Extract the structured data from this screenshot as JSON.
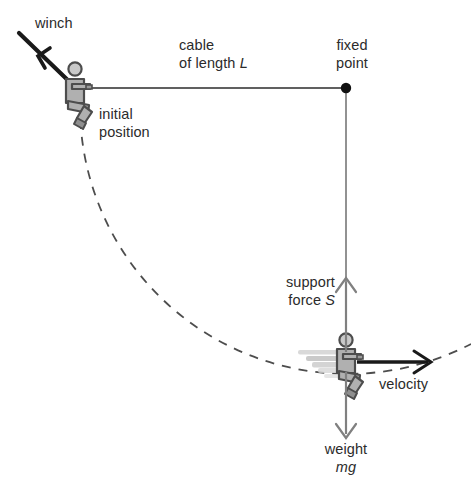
{
  "diagram": {
    "background_color": "#ffffff",
    "labels": {
      "winch": "winch",
      "cable_line1": "cable",
      "cable_line2_prefix": "of length ",
      "cable_line2_symbol": "L",
      "fixed_line1": "fixed",
      "fixed_line2": "point",
      "initial_line1": "initial",
      "initial_line2": "position",
      "support_line1": "support",
      "support_line2_prefix": "force ",
      "support_line2_symbol": "S",
      "velocity": "velocity",
      "weight_line1": "weight",
      "weight_line2": "mg"
    },
    "colors": {
      "stroke_dark": "#2b2b2b",
      "stroke_grey": "#808080",
      "figure_fill": "#b0b0b0",
      "figure_fill_light": "#c9c9c9",
      "figure_outline": "#4d4d4d",
      "dash_arc": "#4d4d4d",
      "blur_trail": "#cfcfcf",
      "text": "#2b2b2b"
    },
    "geometry": {
      "fixed_point": {
        "x": 346,
        "y": 88
      },
      "initial_person": {
        "x": 78,
        "y": 88
      },
      "bottom_person": {
        "x": 346,
        "y": 358
      },
      "cable_length_px": 268,
      "winch_line_start": {
        "x": 16,
        "y": 30
      },
      "winch_line_end": {
        "x": 78,
        "y": 90
      },
      "winch_arrow_tip": {
        "x": 22,
        "y": 37
      },
      "support_arrow": {
        "from_y": 352,
        "to_y": 277
      },
      "weight_arrow": {
        "from_y": 368,
        "to_y": 438
      },
      "velocity_arrow": {
        "from_x": 356,
        "to_x": 430,
        "y": 363
      },
      "arc_end_right": {
        "x": 471,
        "y": 345
      }
    }
  }
}
